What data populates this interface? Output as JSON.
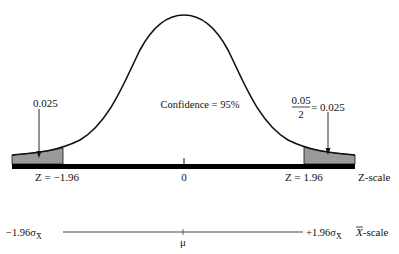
{
  "diagram": {
    "type": "normal-distribution-confidence-interval",
    "confidence_label": "Confidence = 95%",
    "left_tail": {
      "label": "0.025",
      "z_label": "Z = −1.96"
    },
    "right_tail": {
      "fraction_numerator": "0.05",
      "fraction_denominator": "2",
      "equals_label": "= 0.025",
      "z_label": "Z = 1.96"
    },
    "z_axis": {
      "center_label": "0",
      "scale_label": "Z-scale"
    },
    "x_axis": {
      "left_label": "−1.96σ",
      "left_subscript": "X̄",
      "right_label": "+1.96σ",
      "right_subscript": "X̄",
      "center_label": "μ",
      "scale_label_symbol": "X",
      "scale_label_text": "-scale"
    },
    "colors": {
      "curve": "#111111",
      "shaded_tail": "#9a9a9a",
      "axis_bar": "#000000",
      "scale_line": "#555555"
    }
  }
}
